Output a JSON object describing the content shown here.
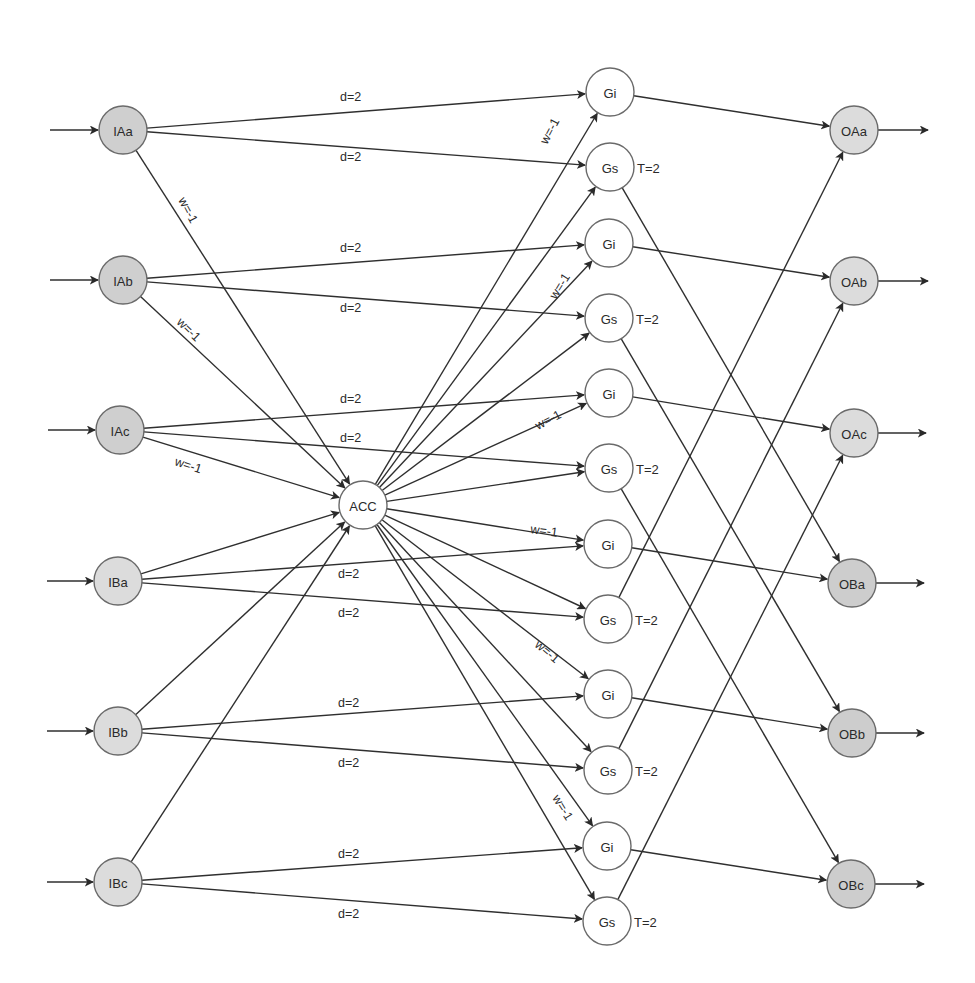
{
  "diagram": {
    "type": "spiking-neural-network",
    "colors": {
      "background": "#ffffff",
      "edge": "#2f2f2f",
      "input_a_fill": "#cfcfcf",
      "input_b_fill": "#dcdcdc",
      "output_a_fill": "#dcdcdc",
      "output_b_fill": "#cdcdcd",
      "gate_fill": "#ffffff",
      "acc_fill": "#ffffff",
      "node_stroke": "#6a6a6a"
    },
    "node_radius": 24,
    "nodes": [
      {
        "id": "IAa",
        "label": "IAa",
        "x": 123,
        "y": 130,
        "fill": "input_a_fill",
        "group": "input"
      },
      {
        "id": "IAb",
        "label": "IAb",
        "x": 123,
        "y": 280,
        "fill": "input_a_fill",
        "group": "input"
      },
      {
        "id": "IAc",
        "label": "IAc",
        "x": 120,
        "y": 430,
        "fill": "input_a_fill",
        "group": "input"
      },
      {
        "id": "IBa",
        "label": "IBa",
        "x": 118,
        "y": 581,
        "fill": "input_b_fill",
        "group": "input"
      },
      {
        "id": "IBb",
        "label": "IBb",
        "x": 118,
        "y": 731,
        "fill": "input_b_fill",
        "group": "input"
      },
      {
        "id": "IBc",
        "label": "IBc",
        "x": 118,
        "y": 882,
        "fill": "input_b_fill",
        "group": "input"
      },
      {
        "id": "ACC",
        "label": "ACC",
        "x": 363,
        "y": 505,
        "fill": "acc_fill",
        "group": "accumulator"
      },
      {
        "id": "Gi1",
        "label": "Gi",
        "x": 610,
        "y": 92,
        "fill": "gate_fill",
        "group": "gate"
      },
      {
        "id": "Gs1",
        "label": "Gs",
        "x": 610,
        "y": 167,
        "fill": "gate_fill",
        "group": "gate",
        "threshold": "T=2"
      },
      {
        "id": "Gi2",
        "label": "Gi",
        "x": 609,
        "y": 243,
        "fill": "gate_fill",
        "group": "gate"
      },
      {
        "id": "Gs2",
        "label": "Gs",
        "x": 609,
        "y": 318,
        "fill": "gate_fill",
        "group": "gate",
        "threshold": "T=2"
      },
      {
        "id": "Gi3",
        "label": "Gi",
        "x": 609,
        "y": 393,
        "fill": "gate_fill",
        "group": "gate"
      },
      {
        "id": "Gs3",
        "label": "Gs",
        "x": 609,
        "y": 468,
        "fill": "gate_fill",
        "group": "gate",
        "threshold": "T=2"
      },
      {
        "id": "Gi4",
        "label": "Gi",
        "x": 608,
        "y": 544,
        "fill": "gate_fill",
        "group": "gate"
      },
      {
        "id": "Gs4",
        "label": "Gs",
        "x": 608,
        "y": 619,
        "fill": "gate_fill",
        "group": "gate",
        "threshold": "T=2"
      },
      {
        "id": "Gi5",
        "label": "Gi",
        "x": 608,
        "y": 694,
        "fill": "gate_fill",
        "group": "gate"
      },
      {
        "id": "Gs5",
        "label": "Gs",
        "x": 608,
        "y": 770,
        "fill": "gate_fill",
        "group": "gate",
        "threshold": "T=2"
      },
      {
        "id": "Gi6",
        "label": "Gi",
        "x": 607,
        "y": 846,
        "fill": "gate_fill",
        "group": "gate"
      },
      {
        "id": "Gs6",
        "label": "Gs",
        "x": 607,
        "y": 921,
        "fill": "gate_fill",
        "group": "gate",
        "threshold": "T=2"
      },
      {
        "id": "OAa",
        "label": "OAa",
        "x": 854,
        "y": 130,
        "fill": "output_a_fill",
        "group": "output"
      },
      {
        "id": "OAb",
        "label": "OAb",
        "x": 854,
        "y": 281,
        "fill": "output_a_fill",
        "group": "output"
      },
      {
        "id": "OAc",
        "label": "OAc",
        "x": 854,
        "y": 433,
        "fill": "output_a_fill",
        "group": "output"
      },
      {
        "id": "OBa",
        "label": "OBa",
        "x": 852,
        "y": 583,
        "fill": "output_b_fill",
        "group": "output"
      },
      {
        "id": "OBb",
        "label": "OBb",
        "x": 852,
        "y": 733,
        "fill": "output_b_fill",
        "group": "output"
      },
      {
        "id": "OBc",
        "label": "OBc",
        "x": 851,
        "y": 884,
        "fill": "output_b_fill",
        "group": "output"
      }
    ],
    "external_inputs": [
      {
        "to": "IAa",
        "x1": 50
      },
      {
        "to": "IAb",
        "x1": 50
      },
      {
        "to": "IAc",
        "x1": 48
      },
      {
        "to": "IBa",
        "x1": 47
      },
      {
        "to": "IBb",
        "x1": 47
      },
      {
        "to": "IBc",
        "x1": 47
      }
    ],
    "external_outputs": [
      {
        "from": "OAa",
        "x2": 928
      },
      {
        "from": "OAb",
        "x2": 928
      },
      {
        "from": "OAc",
        "x2": 926
      },
      {
        "from": "OBa",
        "x2": 924
      },
      {
        "from": "OBb",
        "x2": 924
      },
      {
        "from": "OBc",
        "x2": 924
      }
    ],
    "edges": [
      {
        "from": "IAa",
        "to": "Gi1",
        "label": "d=2",
        "lx": 340,
        "ly": 101,
        "rot": 0
      },
      {
        "from": "IAa",
        "to": "Gs1",
        "label": "d=2",
        "lx": 340,
        "ly": 161,
        "rot": 0
      },
      {
        "from": "IAa",
        "to": "ACC",
        "label": "w=-1",
        "lx": 178,
        "ly": 200,
        "rot": 62
      },
      {
        "from": "IAb",
        "to": "Gi2",
        "label": "d=2",
        "lx": 340,
        "ly": 252,
        "rot": 0
      },
      {
        "from": "IAb",
        "to": "Gs2",
        "label": "d=2",
        "lx": 340,
        "ly": 312,
        "rot": 0
      },
      {
        "from": "IAb",
        "to": "ACC",
        "label": "w=-1",
        "lx": 176,
        "ly": 323,
        "rot": 44
      },
      {
        "from": "IAc",
        "to": "Gi3",
        "label": "d=2",
        "lx": 340,
        "ly": 403,
        "rot": 0
      },
      {
        "from": "IAc",
        "to": "Gs3",
        "label": "d=2",
        "lx": 340,
        "ly": 442,
        "rot": 0
      },
      {
        "from": "IAc",
        "to": "ACC",
        "label": "w=-1",
        "lx": 174,
        "ly": 465,
        "rot": 18
      },
      {
        "from": "IBa",
        "to": "ACC",
        "label": "",
        "lx": 0,
        "ly": 0,
        "rot": 0
      },
      {
        "from": "IBa",
        "to": "Gi4",
        "label": "d=2",
        "lx": 338,
        "ly": 578,
        "rot": 0
      },
      {
        "from": "IBa",
        "to": "Gs4",
        "label": "d=2",
        "lx": 338,
        "ly": 617,
        "rot": 0
      },
      {
        "from": "IBb",
        "to": "ACC",
        "label": "",
        "lx": 0,
        "ly": 0,
        "rot": 0
      },
      {
        "from": "IBb",
        "to": "Gi5",
        "label": "d=2",
        "lx": 338,
        "ly": 707,
        "rot": 0
      },
      {
        "from": "IBb",
        "to": "Gs5",
        "label": "d=2",
        "lx": 338,
        "ly": 767,
        "rot": 0
      },
      {
        "from": "IBc",
        "to": "ACC",
        "label": "",
        "lx": 0,
        "ly": 0,
        "rot": 0
      },
      {
        "from": "IBc",
        "to": "Gi6",
        "label": "d=2",
        "lx": 338,
        "ly": 858,
        "rot": 0
      },
      {
        "from": "IBc",
        "to": "Gs6",
        "label": "d=2",
        "lx": 338,
        "ly": 918,
        "rot": 0
      },
      {
        "from": "ACC",
        "to": "Gi1",
        "label": "w=-1",
        "lx": 547,
        "ly": 145,
        "rot": -62
      },
      {
        "from": "ACC",
        "to": "Gs1",
        "label": "",
        "lx": 0,
        "ly": 0,
        "rot": 0
      },
      {
        "from": "ACC",
        "to": "Gi2",
        "label": "w=-1",
        "lx": 556,
        "ly": 300,
        "rot": -58
      },
      {
        "from": "ACC",
        "to": "Gs2",
        "label": "",
        "lx": 0,
        "ly": 0,
        "rot": 0
      },
      {
        "from": "ACC",
        "to": "Gi3",
        "label": "w=-1",
        "lx": 538,
        "ly": 430,
        "rot": -28
      },
      {
        "from": "ACC",
        "to": "Gs3",
        "label": "",
        "lx": 0,
        "ly": 0,
        "rot": 0
      },
      {
        "from": "ACC",
        "to": "Gi4",
        "label": "w=-1",
        "lx": 530,
        "ly": 533,
        "rot": 8
      },
      {
        "from": "ACC",
        "to": "Gs4",
        "label": "",
        "lx": 0,
        "ly": 0,
        "rot": 0
      },
      {
        "from": "ACC",
        "to": "Gi5",
        "label": "w=-1",
        "lx": 534,
        "ly": 646,
        "rot": 40
      },
      {
        "from": "ACC",
        "to": "Gs5",
        "label": "",
        "lx": 0,
        "ly": 0,
        "rot": 0
      },
      {
        "from": "ACC",
        "to": "Gi6",
        "label": "w=-1",
        "lx": 552,
        "ly": 798,
        "rot": 58
      },
      {
        "from": "ACC",
        "to": "Gs6",
        "label": "",
        "lx": 0,
        "ly": 0,
        "rot": 0
      },
      {
        "from": "Gi1",
        "to": "OAa",
        "label": "",
        "lx": 0,
        "ly": 0,
        "rot": 0
      },
      {
        "from": "Gs1",
        "to": "OBa",
        "label": "",
        "lx": 0,
        "ly": 0,
        "rot": 0
      },
      {
        "from": "Gi2",
        "to": "OAb",
        "label": "",
        "lx": 0,
        "ly": 0,
        "rot": 0
      },
      {
        "from": "Gs2",
        "to": "OBb",
        "label": "",
        "lx": 0,
        "ly": 0,
        "rot": 0
      },
      {
        "from": "Gi3",
        "to": "OAc",
        "label": "",
        "lx": 0,
        "ly": 0,
        "rot": 0
      },
      {
        "from": "Gs3",
        "to": "OBc",
        "label": "",
        "lx": 0,
        "ly": 0,
        "rot": 0
      },
      {
        "from": "Gi4",
        "to": "OBa",
        "label": "",
        "lx": 0,
        "ly": 0,
        "rot": 0
      },
      {
        "from": "Gs4",
        "to": "OAa",
        "label": "",
        "lx": 0,
        "ly": 0,
        "rot": 0
      },
      {
        "from": "Gi5",
        "to": "OBb",
        "label": "",
        "lx": 0,
        "ly": 0,
        "rot": 0
      },
      {
        "from": "Gs5",
        "to": "OAb",
        "label": "",
        "lx": 0,
        "ly": 0,
        "rot": 0
      },
      {
        "from": "Gi6",
        "to": "OBc",
        "label": "",
        "lx": 0,
        "ly": 0,
        "rot": 0
      },
      {
        "from": "Gs6",
        "to": "OAc",
        "label": "",
        "lx": 0,
        "ly": 0,
        "rot": 0
      }
    ]
  }
}
